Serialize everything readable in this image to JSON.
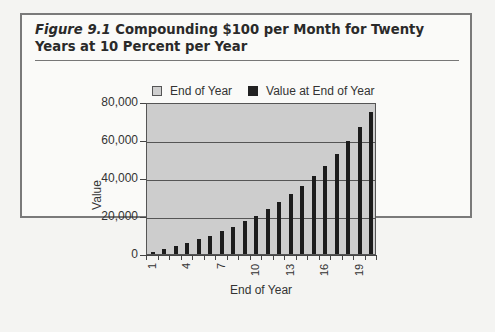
{
  "figure": {
    "label": "Figure 9.1",
    "title": "Compounding $100 per Month for Twenty Years at 10 Percent per Year"
  },
  "legend": {
    "items": [
      {
        "label": "End of Year",
        "swatch": "#cfcfcf"
      },
      {
        "label": "Value at End of Year",
        "swatch": "#222222"
      }
    ]
  },
  "axes": {
    "ylabel": "Value",
    "xlabel": "End of Year",
    "yticks": [
      "80,000",
      "60,000",
      "40,000",
      "20,000",
      "0"
    ],
    "xticks_shown": [
      "1",
      "4",
      "7",
      "10",
      "13",
      "16",
      "19"
    ]
  },
  "colors": {
    "plot_background": "#cdcdcd",
    "bar": "#1c1c1c",
    "frame": "#7a7a7a"
  },
  "chart_data": {
    "type": "bar",
    "title": "Compounding $100 per Month for Twenty Years at 10 Percent per Year",
    "xlabel": "End of Year",
    "ylabel": "Value",
    "ylim": [
      0,
      80000
    ],
    "grid": true,
    "legend_position": "top",
    "legend": [
      "End of Year",
      "Value at End of Year"
    ],
    "categories": [
      1,
      2,
      3,
      4,
      5,
      6,
      7,
      8,
      9,
      10,
      11,
      12,
      13,
      14,
      15,
      16,
      17,
      18,
      19,
      20
    ],
    "series": [
      {
        "name": "Value at End of Year",
        "values": [
          1257,
          2645,
          4178,
          5874,
          7744,
          9811,
          12095,
          14618,
          17405,
          20484,
          23886,
          27644,
          31795,
          36381,
          41447,
          47044,
          53226,
          60056,
          67602,
          75937
        ]
      }
    ],
    "x_tick_labels": [
      "1",
      "4",
      "7",
      "10",
      "13",
      "16",
      "19"
    ],
    "y_tick_labels": [
      "0",
      "20,000",
      "40,000",
      "60,000",
      "80,000"
    ]
  }
}
